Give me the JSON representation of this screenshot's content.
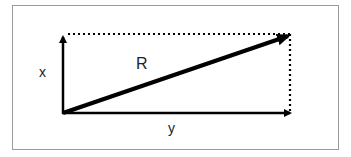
{
  "diagram": {
    "labels": {
      "x": "x",
      "y": "y",
      "resultant": "R"
    },
    "colors": {
      "line": "#000000",
      "border": "#9a9a9a",
      "text": "#222222"
    }
  }
}
